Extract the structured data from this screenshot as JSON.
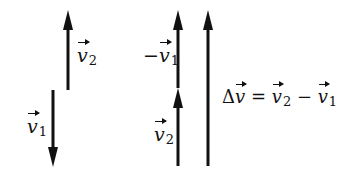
{
  "diagram": {
    "colors": {
      "stroke": "#111111",
      "background": "#ffffff"
    },
    "left_group": {
      "v2_label": {
        "symbol": "v",
        "subscript": "2",
        "prefix": ""
      },
      "v1_label": {
        "symbol": "v",
        "subscript": "1",
        "prefix": ""
      }
    },
    "middle_group": {
      "neg_v1_label": {
        "symbol": "v",
        "subscript": "1",
        "prefix": "−"
      },
      "v2_label": {
        "symbol": "v",
        "subscript": "2",
        "prefix": ""
      }
    },
    "result": {
      "delta": "Δ",
      "symbol": "v",
      "equals": " = ",
      "term1": {
        "symbol": "v",
        "subscript": "2"
      },
      "minus": " − ",
      "term2": {
        "symbol": "v",
        "subscript": "1"
      }
    }
  }
}
